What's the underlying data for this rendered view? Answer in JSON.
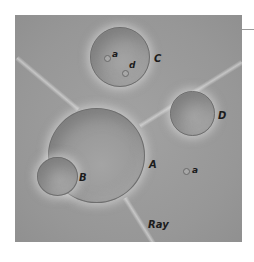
{
  "figure": {
    "background_color": "#9a9a9a",
    "rim_color": "#6e6e6e",
    "label_color": "#1c1c1c"
  },
  "labels": {
    "crater_a": "A",
    "crater_b": "B",
    "crater_c": "C",
    "crater_d": "D",
    "pit_in_c": "a",
    "pit_d_in_c": "d",
    "pit_outside": "a",
    "ray": "Ray"
  }
}
